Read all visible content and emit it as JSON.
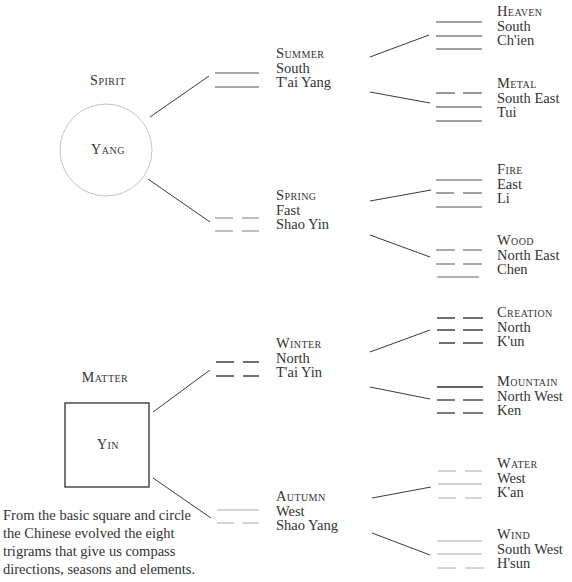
{
  "diagram": {
    "root_nodes": [
      {
        "id": "spirit",
        "heading": "Spirit",
        "shape": "circle",
        "inner_label": "Yang"
      },
      {
        "id": "matter",
        "heading": "Matter",
        "shape": "square",
        "inner_label": "Yin"
      }
    ],
    "seasons": [
      {
        "id": "summer",
        "title": "Summer",
        "direction": "South",
        "name": "T'ai Yang",
        "lines": [
          "solid",
          "solid"
        ]
      },
      {
        "id": "spring",
        "title": "Spring",
        "direction": "Fast",
        "name": "Shao Yin",
        "lines": [
          "broken",
          "broken"
        ]
      },
      {
        "id": "winter",
        "title": "Winter",
        "direction": "North",
        "name": "T'ai Yin",
        "lines": [
          "broken",
          "broken"
        ]
      },
      {
        "id": "autumn",
        "title": "Autumn",
        "direction": "West",
        "name": "Shao Yang",
        "lines": [
          "solid",
          "broken"
        ]
      }
    ],
    "trigrams": [
      {
        "id": "heaven",
        "title": "Heaven",
        "direction": "South",
        "name": "Ch'ien",
        "lines": [
          "solid",
          "solid",
          "solid"
        ]
      },
      {
        "id": "metal",
        "title": "Metal",
        "direction": "South East",
        "name": "Tui",
        "lines": [
          "broken",
          "solid",
          "solid"
        ]
      },
      {
        "id": "fire",
        "title": "Fire",
        "direction": "East",
        "name": "Li",
        "lines": [
          "solid",
          "broken",
          "solid"
        ]
      },
      {
        "id": "wood",
        "title": "Wood",
        "direction": "North East",
        "name": "Chen",
        "lines": [
          "broken",
          "broken",
          "solid"
        ]
      },
      {
        "id": "creation",
        "title": "Creation",
        "direction": "North",
        "name": "K'un",
        "lines": [
          "broken",
          "broken",
          "broken"
        ]
      },
      {
        "id": "mountain",
        "title": "Mountain",
        "direction": "North West",
        "name": "Ken",
        "lines": [
          "solid",
          "broken",
          "broken"
        ]
      },
      {
        "id": "water",
        "title": "Water",
        "direction": "West",
        "name": "K'an",
        "lines": [
          "broken",
          "solid",
          "broken"
        ]
      },
      {
        "id": "wind",
        "title": "Wind",
        "direction": "South West",
        "name": "H'sun",
        "lines": [
          "solid",
          "solid",
          "broken"
        ]
      }
    ],
    "caption": [
      "From the basic square and circle",
      "the Chinese evolved the eight",
      "trigrams that give us compass",
      "directions, seasons and elements."
    ],
    "colors": {
      "ink": "#2a2a2a",
      "line_dark": "#3a3a3a",
      "line_faint": "#9a9a9a",
      "circle_stroke": "#bdbdbd",
      "background": "#ffffff"
    }
  }
}
